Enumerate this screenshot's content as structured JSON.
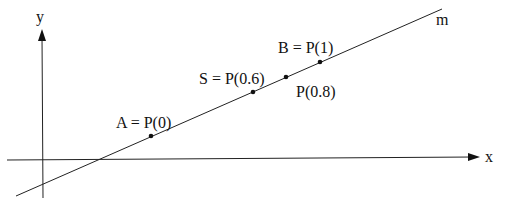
{
  "diagram": {
    "type": "parametric-line-on-axes",
    "axes": {
      "x_label": "x",
      "y_label": "y"
    },
    "line": {
      "label": "m",
      "start": [
        16,
        196
      ],
      "end": [
        442,
        9
      ]
    },
    "points": [
      {
        "id": "A",
        "label": "A = P(0)",
        "t": 0,
        "pos": [
          151,
          136
        ],
        "label_pos": [
          116,
          122
        ]
      },
      {
        "id": "S",
        "label": "S = P(0.6)",
        "t": 0.6,
        "pos": [
          253,
          92
        ],
        "label_pos": [
          198,
          80
        ]
      },
      {
        "id": "P08",
        "label": "P(0.8)",
        "t": 0.8,
        "pos": [
          286,
          77
        ],
        "label_pos": [
          296,
          94
        ]
      },
      {
        "id": "B",
        "label": "B = P(1)",
        "t": 1,
        "pos": [
          320,
          62
        ],
        "label_pos": [
          278,
          50
        ]
      }
    ],
    "colors": {
      "ink": "#111111",
      "background": "#ffffff"
    }
  }
}
